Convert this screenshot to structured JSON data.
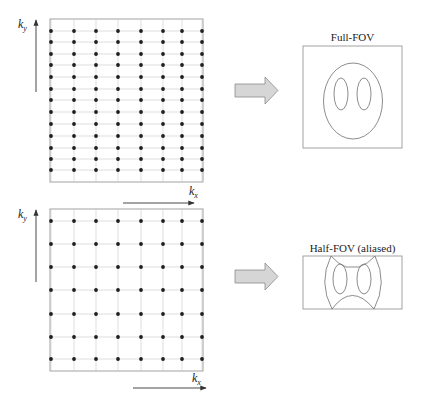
{
  "diagram": {
    "colors": {
      "grid_line": "#c8c8c8",
      "dot": "#1e1e1e",
      "frame": "#8a8a8a",
      "arrow_fill": "#d6d6d6",
      "arrow_stroke": "#8c8c8c",
      "shape_stroke": "#6e6e6e",
      "axis_arrow": "#333333"
    },
    "top_panel": {
      "kspace": {
        "frame": {
          "x": 50,
          "y": 19,
          "w": 153,
          "h": 163
        },
        "columns_x": [
          51,
          74,
          96,
          118,
          141,
          163,
          182,
          202
        ],
        "rows_y": [
          31,
          42,
          54,
          65,
          77,
          89,
          100,
          112,
          124,
          136,
          148,
          159,
          170
        ],
        "ky_label": "k",
        "ky_sub": "y",
        "kx_label": "k",
        "kx_sub": "x"
      },
      "result": {
        "title": "Full-FOV",
        "frame": {
          "x": 303,
          "y": 46,
          "w": 99,
          "h": 102
        }
      }
    },
    "bottom_panel": {
      "kspace": {
        "frame": {
          "x": 50,
          "y": 209,
          "w": 153,
          "h": 162
        },
        "columns_x": [
          51,
          74,
          96,
          118,
          141,
          163,
          182,
          202
        ],
        "rows_y": [
          221,
          244,
          267,
          290,
          314,
          337,
          359
        ],
        "ky_label": "k",
        "ky_sub": "y",
        "kx_label": "k",
        "kx_sub": "x"
      },
      "result": {
        "title": "Half-FOV (aliased)",
        "frame": {
          "x": 303,
          "y": 256,
          "w": 99,
          "h": 53
        }
      }
    }
  }
}
